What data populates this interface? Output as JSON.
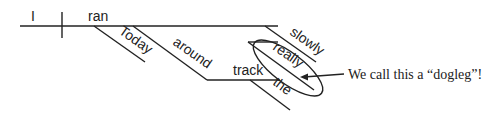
{
  "diagram": {
    "type": "Reed-Kellogg sentence diagram",
    "words": {
      "subject": "I",
      "verb": "ran",
      "mod1": "Today",
      "prep": "around",
      "object": "track",
      "article": "the",
      "adverb": "slowly",
      "adverb_mod": "really"
    },
    "annotation": "We call this a “dogleg”!"
  }
}
